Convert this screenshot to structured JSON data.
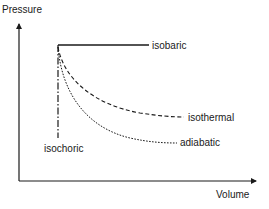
{
  "diagram": {
    "type": "pressure-volume diagram",
    "axes": {
      "y_label": "Pressure",
      "x_label": "Volume"
    },
    "processes": [
      {
        "name": "isobaric",
        "label": "isobaric",
        "line_style": "solid"
      },
      {
        "name": "isochoric",
        "label": "isochoric",
        "line_style": "dash-dot"
      },
      {
        "name": "isothermal",
        "label": "isothermal",
        "line_style": "dashed"
      },
      {
        "name": "adiabatic",
        "label": "adiabatic",
        "line_style": "dotted"
      }
    ],
    "colors": {
      "line": "#1a1a1a",
      "background": "#ffffff"
    }
  }
}
